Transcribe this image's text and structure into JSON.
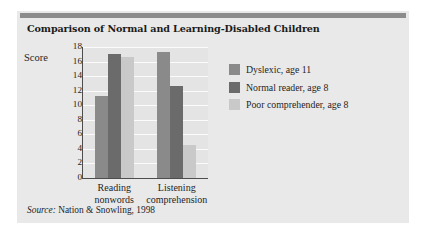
{
  "card": {
    "background_color": "#e9e9e9",
    "top_rule_color": "#8c8c8c"
  },
  "title": "Comparison of Normal and Learning-Disabled Children",
  "source": {
    "label": "Source:",
    "text": "Nation & Snowling, 1998"
  },
  "legend": {
    "position": "right",
    "entries": [
      {
        "label": "Dyslexic, age 11",
        "color": "#8a8a8a"
      },
      {
        "label": "Normal reader, age 8",
        "color": "#6b6b6b"
      },
      {
        "label": "Poor comprehender, age 8",
        "color": "#c9c9c9"
      }
    ]
  },
  "chart_data": {
    "type": "bar",
    "title": "Comparison of Normal and Learning-Disabled Children",
    "xlabel": "",
    "ylabel": "Score",
    "ylim": [
      0,
      18
    ],
    "ytick_step": 2,
    "yticks": [
      18,
      16,
      14,
      12,
      10,
      8,
      6,
      4,
      2,
      0
    ],
    "grid": true,
    "grid_axis": "y",
    "categories": [
      "Reading nonwords",
      "Listening comprehension"
    ],
    "category_lines": [
      [
        "Reading",
        "nonwords"
      ],
      [
        "Listening",
        "comprehension"
      ]
    ],
    "series": [
      {
        "name": "Dyslexic, age 11",
        "color": "#8a8a8a",
        "values": [
          11.3,
          17.3
        ]
      },
      {
        "name": "Normal reader, age 8",
        "color": "#6b6b6b",
        "values": [
          17.0,
          12.7
        ]
      },
      {
        "name": "Poor comprehender, age 8",
        "color": "#c9c9c9",
        "values": [
          16.6,
          4.6
        ]
      }
    ]
  }
}
